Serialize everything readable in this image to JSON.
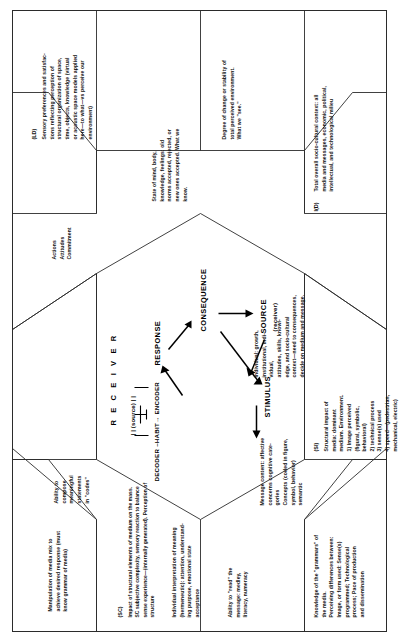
{
  "figure": {
    "orientation": "rotated-90-ccw",
    "line_color": "#2b2b2b",
    "text_color": "#111111"
  },
  "center": {
    "receiver_header": "R E C E I V E R",
    "source_marker": "| | (source) |  |",
    "chain": "DECODER –HABIT→ ENCODER",
    "nodes": [
      {
        "id": "stimulus",
        "label": "STIMULUS"
      },
      {
        "id": "response",
        "label": "RESPONSE"
      },
      {
        "id": "consequence",
        "label": "CONSEQUENCE"
      },
      {
        "id": "source",
        "label": "SOURCE",
        "sublabel": "(receiver)"
      }
    ]
  },
  "panels": [
    {
      "id": "media-mix",
      "code": "",
      "text": "Manipulation of media mix to\nachieve desired response (must\nknow grammar of media)"
    },
    {
      "id": "ld",
      "code": "(LD)",
      "text": "Sensory preferences and satisfac-\ntions reflecting perception of\nstructural organization of space,\ntime, objects, knowledge (virtual\nor acoustic space models applied\nhere—to what—vs perceive our\nenvironment)"
    },
    {
      "id": "actions",
      "code": "",
      "text": "Actions\nAttitudes\nCommitment"
    },
    {
      "id": "stability",
      "code": "",
      "text": "Degree of change or stability of\ntotal perceived environment.\nWhat we \"see.\""
    },
    {
      "id": "compose",
      "code": "",
      "text": "Ability to\ncompose\nmeaningful\nstatements\nin \"codes\""
    },
    {
      "id": "sc",
      "code": "(SC)",
      "text": "Impact of structural elements of medium on the mass.\nSC subjective complexity, sensory reaction to balance\nsense experience—(internally generated). Perception of\nstructure"
    },
    {
      "id": "interpretation",
      "code": "",
      "text": "Individual interpretation of meaning\n(hermeneutic): attention, understand-\ning purpose, emotional state\nacceptance"
    },
    {
      "id": "state-of-mind",
      "code": "",
      "text": "State of mind, body,\nknowledge, feelings: old\nnorms accepted, rejected, or\nnew ones accepted. What we\nknow."
    },
    {
      "id": "read",
      "code": "",
      "text": "Ability to \"read\" the\nmessage: medley,\nliteracy, numeracy"
    },
    {
      "id": "message-content",
      "code": "",
      "text": "Message content: affective\nconcerns cognitive cate-\ngories\nConcepts (coded in figure,\nsymbol, behavior)\nsemantic"
    },
    {
      "id": "individual-growth",
      "code": "",
      "text": "Individual: growth,\ninstitutional, indi-\nvidual,\nattitudes, skills, knowl-\nedge, and socio-cultural\ncontext—need to consequences,\ndecide on medium and message."
    },
    {
      "id": "id",
      "code": "I(D)",
      "text": "Total overall socio-cultural context: all\nmedia and messages, economic, political,\nintellectual, and technological milieu"
    },
    {
      "id": "grammars",
      "code": "",
      "text": "Knowledge of the \"grammars\" of\nthe media.\nPerceiving differences between:\nImage, or form used: Sense(s)\nprogrammed; Technological\nprocess; Pace of production\nand dissemination"
    },
    {
      "id": "si",
      "code": "(SI)",
      "text": "Structural impact of\nmedia: dominant\nmedium. Environment.\n1) Image perceived\n(figural, symbolic,\nbehavioral)\n2) technical process\n3) sense(s) used\n4) speed—(pedestrian,\nmechanical, electric)"
    }
  ]
}
